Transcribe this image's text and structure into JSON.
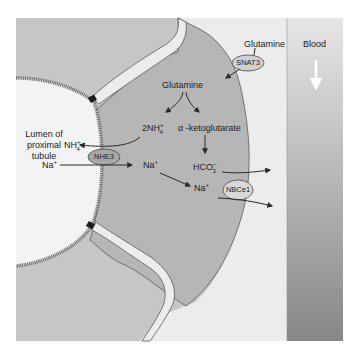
{
  "diagram": {
    "type": "physiology-cell-transport",
    "colors": {
      "background": "#ffffff",
      "panel": "#c4c4c4",
      "cell": "#b5b5b5",
      "lumen": "#f2f2f2",
      "interstitium": "#efefef",
      "brush_border": "#6e6e6e",
      "tight_junction": "#1e1e1e",
      "blood_top": "#e2e2e2",
      "blood_bottom": "#8a8a8a",
      "arrow": "#2a2a2a"
    },
    "regions": {
      "lumen": {
        "line1": "Lumen of",
        "line2": "proximal",
        "line3": "tubule"
      },
      "blood": {
        "label": "Blood",
        "flow_arrow": "down-arrow-icon"
      }
    },
    "transporters": [
      {
        "id": "snat3",
        "label": "SNAT3"
      },
      {
        "id": "nhe3",
        "label": "NHE3"
      },
      {
        "id": "nbce1",
        "label": "NBCe1"
      }
    ],
    "molecules": {
      "glutamine_blood": "Glutamine",
      "glutamine_cell": "Glutamine",
      "ammonium_cell": {
        "coef": "2NH",
        "sup": "+",
        "sub": "4"
      },
      "ammonium_lumen": {
        "base": "NH",
        "sup": "+",
        "sub": "4"
      },
      "alpha_kg": "α -ketoglutarate",
      "bicarbonate": {
        "base": "HCO",
        "sup": "−",
        "sub": "3"
      },
      "sodium_lumen": {
        "base": "Na",
        "sup": "+"
      },
      "sodium_cell_1": {
        "base": "Na",
        "sup": "+"
      },
      "sodium_cell_2": {
        "base": "Na",
        "sup": "+"
      }
    }
  }
}
